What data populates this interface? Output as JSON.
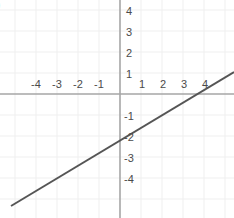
{
  "figure": {
    "corner_label": ")",
    "width": 234,
    "height": 218,
    "background_color": "#ffffff"
  },
  "colors": {
    "axis": "#a6a6a6",
    "grid": "#efefef",
    "line": "#555555",
    "tick_text": "#4a4a4a",
    "corner_text": "#3a3a3a"
  },
  "chart_data": {
    "type": "line",
    "title": "",
    "xlabel": "",
    "ylabel": "",
    "xlim": [
      -5.7,
      5.4
    ],
    "ylim": [
      -5.9,
      4.5
    ],
    "grid": true,
    "legend": "none",
    "x_tick_labels": [
      "-4",
      "-3",
      "-2",
      "-1",
      "1",
      "2",
      "3",
      "4"
    ],
    "x_tick_values": [
      -4,
      -3,
      -2,
      -1,
      1,
      2,
      3,
      4
    ],
    "y_tick_labels": [
      "4",
      "3",
      "2",
      "1",
      "-1",
      "-2",
      "-3",
      "-4"
    ],
    "y_tick_values": [
      4,
      3,
      2,
      1,
      -1,
      -2,
      -3,
      -4
    ],
    "series": [
      {
        "name": "line",
        "equation": "y = x/2 - 2",
        "slope": 0.5,
        "y_intercept": -2,
        "x_intercept": 4,
        "x": [
          -5.2,
          5.4
        ],
        "values": [
          -4.6,
          0.7
        ],
        "color": "#555555"
      }
    ],
    "annotations": []
  },
  "geometry": {
    "origin_x": 120,
    "origin_y": 94,
    "unit_px": 21,
    "line_start_px": {
      "x": 11,
      "y": 206
    },
    "line_end_px": {
      "x": 234,
      "y": 72
    }
  }
}
